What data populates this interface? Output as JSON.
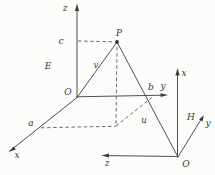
{
  "diagram": {
    "point_label": "P",
    "vector_labels": {
      "v": "v",
      "u": "u"
    },
    "coordinate_labels": {
      "a": "a",
      "b": "b",
      "c": "c"
    },
    "frame_E": {
      "region_label": "E",
      "origin_label": "O",
      "axis_x": "x",
      "axis_y": "y",
      "axis_z": "z"
    },
    "frame_H": {
      "region_label": "H",
      "origin_label": "O",
      "axis_x": "x",
      "axis_y": "y",
      "axis_z": "z"
    },
    "colors": {
      "background": "#fcfcfb",
      "line": "#4f4f4f",
      "text": "#3a3a3a"
    }
  }
}
